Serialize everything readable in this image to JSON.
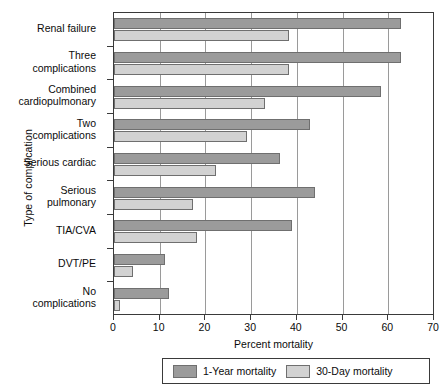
{
  "chart_data": {
    "type": "bar",
    "orientation": "horizontal",
    "title": "",
    "xlabel": "Percent mortality",
    "ylabel": "Type of complication",
    "xlim": [
      0,
      70
    ],
    "xticks": [
      0,
      10,
      20,
      30,
      40,
      50,
      60,
      70
    ],
    "grid": "vertical",
    "legend_position": "bottom",
    "categories": [
      "Renal failure",
      "Three\ncomplications",
      "Combined\ncardiopulmonary",
      "Two\ncomplications",
      "Serious cardiac",
      "Serious\npulmonary",
      "TIA/CVA",
      "DVT/PE",
      "No\ncomplications"
    ],
    "series": [
      {
        "name": "1-Year mortality",
        "color": "#9b9b9b",
        "values": [
          62.8,
          62.8,
          58.3,
          42.9,
          36.4,
          44.0,
          38.9,
          11.2,
          12.1
        ]
      },
      {
        "name": "30-Day mortality",
        "color": "#d2d2d2",
        "values": [
          38.3,
          38.3,
          33.0,
          29.0,
          22.3,
          17.3,
          18.1,
          4.1,
          1.3
        ]
      }
    ]
  },
  "legend": {
    "items": [
      {
        "label": "1-Year mortality"
      },
      {
        "label": "30-Day mortality"
      }
    ]
  }
}
